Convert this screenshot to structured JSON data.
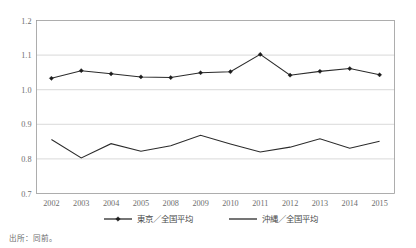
{
  "chart_data": {
    "type": "line",
    "title": "",
    "xlabel": "",
    "ylabel": "",
    "categories": [
      "2002",
      "2003",
      "2004",
      "2005",
      "2008",
      "2009",
      "2010",
      "2011",
      "2012",
      "2013",
      "2014",
      "2015"
    ],
    "ylim": [
      0.7,
      1.2
    ],
    "yticks": [
      "0.7",
      "0.8",
      "0.9",
      "1.0",
      "1.1",
      "1.2"
    ],
    "ytick_values": [
      0.7,
      0.8,
      0.9,
      1.0,
      1.1,
      1.2
    ],
    "grid": true,
    "legend_position": "bottom",
    "series": [
      {
        "name": "東京／全国平均",
        "marker": "diamond",
        "color": "#2b2b2b",
        "values": [
          1.033,
          1.055,
          1.046,
          1.037,
          1.035,
          1.049,
          1.052,
          1.102,
          1.042,
          1.053,
          1.061,
          1.043
        ]
      },
      {
        "name": "沖縄／全国平均",
        "marker": "none",
        "color": "#2b2b2b",
        "values": [
          0.856,
          0.803,
          0.844,
          0.822,
          0.838,
          0.868,
          0.843,
          0.82,
          0.834,
          0.858,
          0.831,
          0.851
        ]
      }
    ]
  },
  "legend": {
    "items": [
      {
        "label": "東京／全国平均"
      },
      {
        "label": "沖縄／全国平均"
      }
    ]
  },
  "source": {
    "note": "出所：同前。"
  }
}
